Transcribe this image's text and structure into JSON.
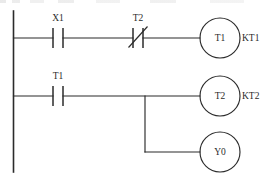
{
  "diagram": {
    "type": "ladder-logic",
    "rails": {
      "left_rail_label": "left-power-rail"
    },
    "rungs": [
      {
        "id": "rung-1",
        "y": 38,
        "contacts": [
          {
            "id": "contact-x1",
            "label": "X1",
            "kind": "normally-open",
            "x": 58
          },
          {
            "id": "contact-t2",
            "label": "T2",
            "kind": "normally-closed",
            "x": 138
          }
        ],
        "coil": {
          "id": "coil-t1",
          "label": "T1",
          "side_label": "KT1",
          "cx": 220,
          "cy": 38,
          "r": 20
        }
      },
      {
        "id": "rung-2",
        "y": 96,
        "contacts": [
          {
            "id": "contact-t1",
            "label": "T1",
            "kind": "normally-open",
            "x": 58
          }
        ],
        "coil": {
          "id": "coil-t2",
          "label": "T2",
          "side_label": "KT2",
          "cx": 220,
          "cy": 96,
          "r": 20
        },
        "branch": {
          "id": "branch-y0",
          "x": 145,
          "from_y": 96,
          "to_y": 152,
          "coil": {
            "id": "coil-y0",
            "label": "Y0",
            "side_label": "",
            "cx": 220,
            "cy": 152,
            "r": 20
          }
        }
      }
    ],
    "colors": {
      "line": "#2b2b2b",
      "background": "#ffffff",
      "text": "#2b2b2b"
    }
  }
}
